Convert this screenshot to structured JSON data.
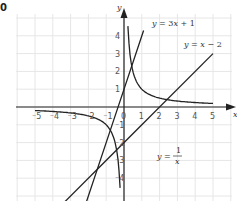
{
  "corner_label": "0",
  "chart_data": {
    "type": "line",
    "title": "",
    "xlabel": "x",
    "ylabel": "y",
    "xlim": [
      -5.5,
      5.5
    ],
    "ylim": [
      -5.2,
      5.2
    ],
    "grid": true,
    "x_ticks": [
      "-5",
      "-4",
      "-3",
      "-2",
      "-1",
      "0",
      "1",
      "2",
      "3",
      "4",
      "5"
    ],
    "y_ticks": [
      "4",
      "3",
      "2",
      "1",
      "-1",
      "-2",
      "-3",
      "-4"
    ],
    "series": [
      {
        "name": "y = 3x + 1",
        "label": "y = 3x + 1",
        "formula": "3x+1",
        "x_range": [
          -2.1,
          1.1
        ]
      },
      {
        "name": "y = x - 2",
        "label": "y = x − 2",
        "formula": "x-2",
        "x_range": [
          -4.2,
          5
        ]
      },
      {
        "name": "y = 1/x",
        "label_prefix": "y = ",
        "label_num": "1",
        "label_den": "x",
        "formula": "1/x",
        "x_range_pos": [
          0.22,
          5
        ],
        "x_range_neg": [
          -5,
          -0.22
        ]
      }
    ],
    "intersections": [
      {
        "lines": [
          "y=3x+1",
          "y=x-2"
        ],
        "point": [
          -1.5,
          -3.5
        ]
      }
    ]
  }
}
